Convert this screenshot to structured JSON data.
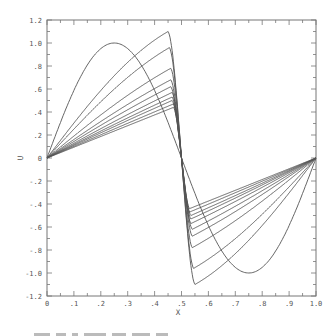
{
  "chart_data": {
    "type": "line",
    "title": "",
    "xlabel": "X",
    "ylabel": "U",
    "xlim": [
      0,
      1.0
    ],
    "ylim": [
      -1.2,
      1.2
    ],
    "xticks": [
      "0",
      ".1",
      ".2",
      ".3",
      ".4",
      ".5",
      ".6",
      ".7",
      ".8",
      ".9",
      "1.0"
    ],
    "yticks": [
      "1.2",
      "1.0",
      ".8",
      ".6",
      ".4",
      ".2",
      "0",
      "-.2",
      "-.4",
      "-.6",
      "-.8",
      "-1.0",
      "-1.2"
    ],
    "grid": false,
    "legend": null,
    "series": [
      {
        "name": "initial",
        "peak_x": 0.25,
        "peak": 1.0
      },
      {
        "name": "curve-1",
        "peak_x": 0.45,
        "peak": 1.1
      },
      {
        "name": "curve-2",
        "peak_x": 0.455,
        "peak": 0.96
      },
      {
        "name": "curve-3",
        "peak_x": 0.46,
        "peak": 0.78
      },
      {
        "name": "curve-4",
        "peak_x": 0.46,
        "peak": 0.68
      },
      {
        "name": "curve-5",
        "peak_x": 0.46,
        "peak": 0.62
      },
      {
        "name": "curve-6",
        "peak_x": 0.465,
        "peak": 0.57
      },
      {
        "name": "curve-7",
        "peak_x": 0.465,
        "peak": 0.53
      },
      {
        "name": "curve-8",
        "peak_x": 0.465,
        "peak": 0.5
      },
      {
        "name": "curve-9",
        "peak_x": 0.47,
        "peak": 0.47
      },
      {
        "name": "curve-10",
        "peak_x": 0.47,
        "peak": 0.44
      }
    ]
  },
  "colors": {
    "line": "#555555",
    "axis": "#777777",
    "text": "#555555"
  }
}
